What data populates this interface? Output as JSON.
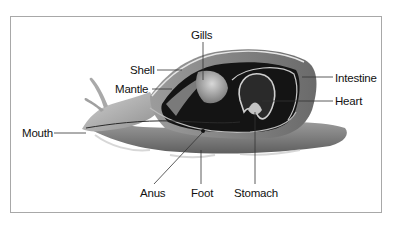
{
  "diagram": {
    "labels": {
      "gills": "Gills",
      "shell": "Shell",
      "mantle": "Mantle",
      "intestine": "Intestine",
      "heart": "Heart",
      "mouth": "Mouth",
      "anus": "Anus",
      "foot": "Foot",
      "stomach": "Stomach"
    },
    "colors": {
      "frame": "#a8a8a8",
      "body_light": "#b9b9b9",
      "body_mid": "#8a8a8a",
      "cavity": "#141414",
      "leader": "#333333"
    }
  }
}
